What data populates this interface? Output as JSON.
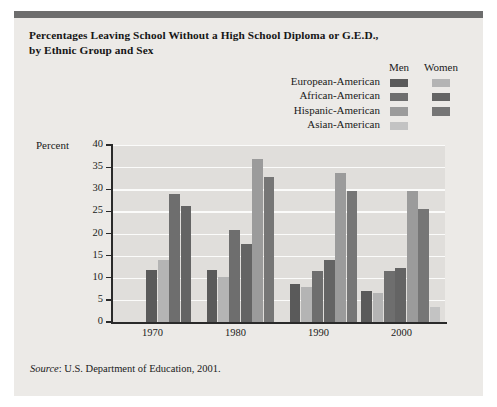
{
  "figure": {
    "title_line1": "Percentages Leaving School Without a High School Diploma or G.E.D.,",
    "title_line2": "by Ethnic Group and Sex",
    "source_label": "Source",
    "source_text": ": U.S. Department of Education, 2001.",
    "background_color": "#eceae7",
    "plot_background_color": "#e0dedb",
    "rule_color": "#6d6d6d"
  },
  "legend": {
    "col_men": "Men",
    "col_women": "Women",
    "rows": [
      {
        "label": "European-American",
        "men_color": "#5a5a5a",
        "women_color": "#b4b4b4",
        "women_visible": true
      },
      {
        "label": "African-American",
        "men_color": "#6e6e6e",
        "women_color": "#646464",
        "women_visible": true
      },
      {
        "label": "Hispanic-American",
        "men_color": "#9b9b9b",
        "women_color": "#767676",
        "women_visible": true
      },
      {
        "label": "Asian-American",
        "men_color": "#c3c3c3",
        "women_color": "#c3c3c3",
        "women_visible": false
      }
    ]
  },
  "chart_data": {
    "type": "bar",
    "title": "Percentages Leaving School Without a High School Diploma or G.E.D., by Ethnic Group and Sex",
    "xlabel": "",
    "ylabel": "Percent",
    "ylim": [
      0,
      40
    ],
    "yticks": [
      0,
      5,
      10,
      15,
      20,
      25,
      30,
      35,
      40
    ],
    "grid": true,
    "legend_position": "top-right",
    "categories": [
      "1970",
      "1980",
      "1990",
      "2000"
    ],
    "series": [
      {
        "name": "European-American Men",
        "color": "#5a5a5a",
        "values": [
          11.8,
          11.7,
          8.6,
          7.0
        ]
      },
      {
        "name": "European-American Women",
        "color": "#b4b4b4",
        "values": [
          14.0,
          10.2,
          8.0,
          6.5
        ]
      },
      {
        "name": "African-American Men",
        "color": "#6e6e6e",
        "values": [
          28.9,
          20.7,
          11.6,
          11.5
        ]
      },
      {
        "name": "African-American Women",
        "color": "#646464",
        "values": [
          26.3,
          17.6,
          14.0,
          12.3
        ]
      },
      {
        "name": "Hispanic-American Men",
        "color": "#9b9b9b",
        "values": [
          null,
          36.9,
          33.6,
          29.6
        ]
      },
      {
        "name": "Hispanic-American Women",
        "color": "#767676",
        "values": [
          null,
          32.7,
          29.5,
          25.5
        ]
      },
      {
        "name": "Asian-American Men",
        "color": "#c3c3c3",
        "values": [
          null,
          null,
          null,
          3.5
        ]
      }
    ]
  },
  "axis": {
    "ytick_labels": [
      "0",
      "5",
      "10",
      "15",
      "20",
      "25",
      "30",
      "35",
      "40"
    ],
    "xtick_labels": [
      "1970",
      "1980",
      "1990",
      "2000"
    ]
  }
}
